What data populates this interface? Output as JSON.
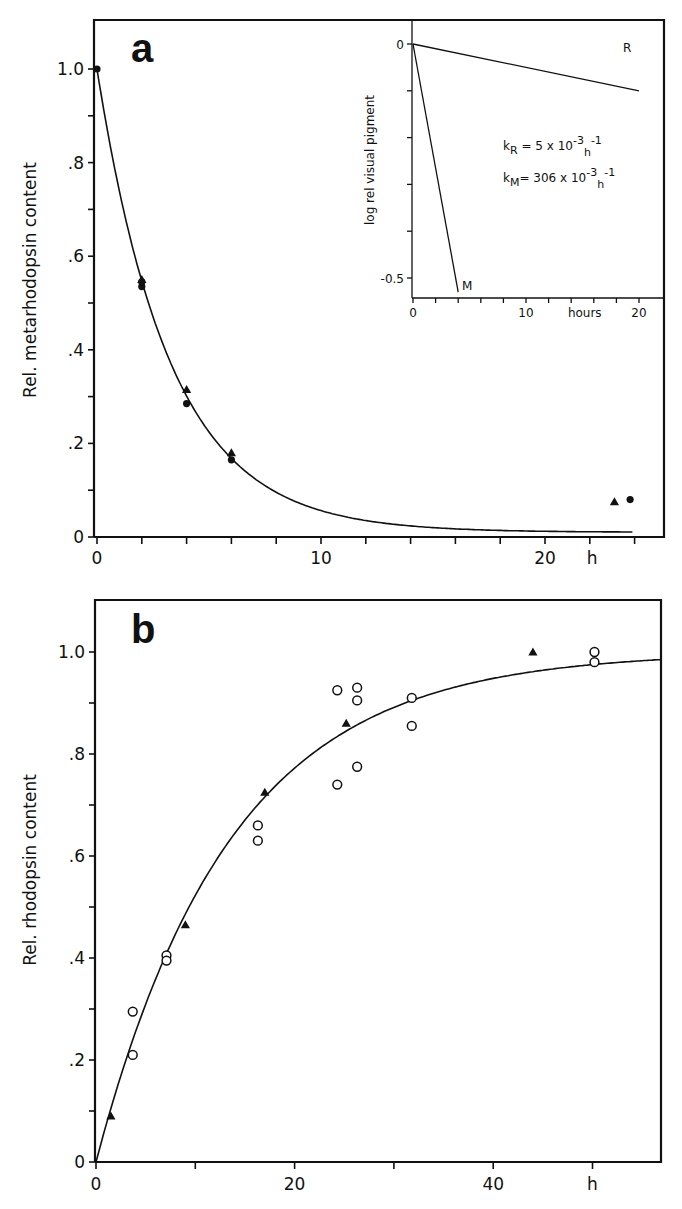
{
  "chart_data": [
    {
      "panel": "a",
      "type": "scatter",
      "panel_label": "a",
      "xlabel": "h",
      "ylabel": "Rel. metarhodopsin content",
      "xlim": [
        0,
        24
      ],
      "ylim": [
        0,
        1.1
      ],
      "x_ticks": [
        0,
        10,
        20
      ],
      "x_tick_labels": [
        "0",
        "10",
        "20"
      ],
      "x_minor_step": 2,
      "y_ticks": [
        0,
        0.2,
        0.4,
        0.6,
        0.8,
        1.0
      ],
      "y_tick_labels": [
        "0",
        ".2",
        ".4",
        ".6",
        ".8",
        "1.0"
      ],
      "y_minor_step": 0.1,
      "grid": false,
      "fit_curve": {
        "model": "exponential decay",
        "k_per_h": 0.306,
        "x_range": [
          0,
          24
        ]
      },
      "series": [
        {
          "name": "filled circles",
          "marker": "circle-filled",
          "x": [
            0,
            2,
            2,
            4,
            6,
            23.8
          ],
          "y": [
            1.0,
            0.535,
            0.545,
            0.285,
            0.165,
            0.08
          ]
        },
        {
          "name": "filled triangles",
          "marker": "triangle-filled",
          "x": [
            2,
            4,
            6,
            23.1
          ],
          "y": [
            0.55,
            0.315,
            0.18,
            0.075
          ]
        }
      ],
      "inset": {
        "type": "line",
        "xlabel": "hours",
        "ylabel": "log rel visual pigment",
        "xlim": [
          0,
          22
        ],
        "ylim": [
          -0.55,
          0.05
        ],
        "x_ticks": [
          0,
          10,
          20
        ],
        "x_tick_labels": [
          "0",
          "10",
          "20"
        ],
        "x_minor_step": 2,
        "y_ticks": [
          0,
          -0.5
        ],
        "y_tick_labels": [
          "0",
          "-0.5"
        ],
        "y_minor_step": 0.1,
        "series": [
          {
            "name": "R",
            "x": [
              0,
              20
            ],
            "y": [
              0,
              -0.1
            ]
          },
          {
            "name": "M",
            "x": [
              0,
              4
            ],
            "y": [
              0,
              -0.53
            ]
          }
        ],
        "annotations": [
          {
            "text": "kR = 5 x 10^-3 h^-1",
            "k": "R",
            "value": "5",
            "exp": "-3",
            "unit_exp": "-1"
          },
          {
            "text": "kM = 306 x 10^-3 h^-1",
            "k": "M",
            "value": "306",
            "exp": "-3",
            "unit_exp": "-1"
          }
        ]
      }
    },
    {
      "panel": "b",
      "type": "scatter",
      "panel_label": "b",
      "xlabel": "h",
      "ylabel": "Rel. rhodopsin content",
      "xlim": [
        0,
        58
      ],
      "ylim": [
        0,
        1.1
      ],
      "x_ticks": [
        0,
        20,
        40
      ],
      "x_tick_labels": [
        "0",
        "20",
        "40"
      ],
      "x_minor_step": 10,
      "y_ticks": [
        0,
        0.2,
        0.4,
        0.6,
        0.8,
        1.0
      ],
      "y_tick_labels": [
        "0",
        ".2",
        ".4",
        ".6",
        ".8",
        "1.0"
      ],
      "y_minor_step": 0.1,
      "grid": false,
      "fit_curve": {
        "model": "1 - exp(-k t)",
        "k_per_h": 0.074,
        "x_range": [
          0,
          57
        ]
      },
      "series": [
        {
          "name": "open circles",
          "marker": "circle-open",
          "x": [
            3.7,
            3.7,
            7.1,
            7.1,
            16.3,
            16.3,
            24.3,
            24.3,
            26.3,
            26.3,
            26.3,
            31.8,
            31.8,
            50.2,
            50.2
          ],
          "y": [
            0.295,
            0.21,
            0.405,
            0.395,
            0.66,
            0.63,
            0.925,
            0.74,
            0.93,
            0.905,
            0.775,
            0.91,
            0.855,
            1.0,
            0.98
          ]
        },
        {
          "name": "filled triangles",
          "marker": "triangle-filled",
          "x": [
            1.5,
            9.0,
            17.0,
            25.2,
            44.0
          ],
          "y": [
            0.09,
            0.465,
            0.725,
            0.86,
            1.0
          ]
        }
      ]
    }
  ]
}
